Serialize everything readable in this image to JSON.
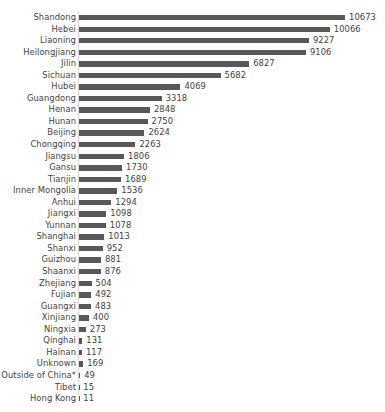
{
  "chart_data": {
    "type": "bar",
    "orientation": "horizontal",
    "title": "",
    "xlabel": "",
    "ylabel": "",
    "grid": false,
    "legend": false,
    "xlim": [
      0,
      10673
    ],
    "value_labels_shown": true,
    "categories": [
      "Shandong",
      "Hebei",
      "Liaoning",
      "Heilongjiang",
      "Jilin",
      "Sichuan",
      "Hubei",
      "Guangdong",
      "Henan",
      "Hunan",
      "Beijing",
      "Chongqing",
      "Jiangsu",
      "Gansu",
      "Tianjin",
      "Inner Mongolia",
      "Anhui",
      "Jiangxi",
      "Yunnan",
      "Shanghai",
      "Shanxi",
      "Guizhou",
      "Shaanxi",
      "Zhejiang",
      "Fujian",
      "Guangxi",
      "Xinjiang",
      "Ningxia",
      "Qinghai",
      "Hainan",
      "Unknown",
      "Outside of China*",
      "Tibet",
      "Hong Kong"
    ],
    "values": [
      10673,
      10066,
      9227,
      9106,
      6827,
      5682,
      4069,
      3318,
      2848,
      2750,
      2624,
      2263,
      1806,
      1730,
      1689,
      1536,
      1294,
      1098,
      1078,
      1013,
      952,
      881,
      876,
      504,
      492,
      483,
      400,
      273,
      131,
      117,
      169,
      49,
      15,
      11
    ]
  },
  "style": {
    "bar_color": "#585858",
    "text_color": "#3f3f3f",
    "axis_color": "#d6d6d6",
    "background": "#ffffff"
  }
}
